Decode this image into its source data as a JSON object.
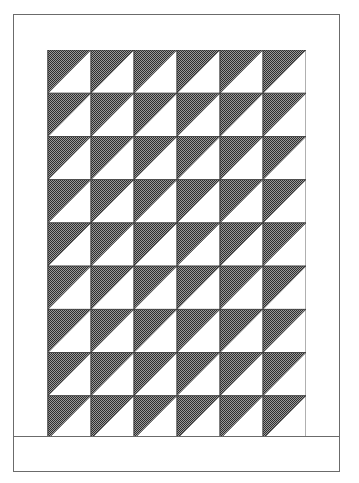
{
  "diagram": {
    "type": "quilt-pattern",
    "block": "half-square-triangle",
    "columns": 6,
    "rows": 9,
    "dark_position": "upper-left",
    "light_position": "lower-right",
    "colors": {
      "dark": "#5a5a5a",
      "light": "#ffffff",
      "line": "#3a3a3a",
      "border": "#6b6b6b"
    },
    "borders": [
      "top-band",
      "bottom-band",
      "left-strip",
      "right-strip"
    ]
  }
}
